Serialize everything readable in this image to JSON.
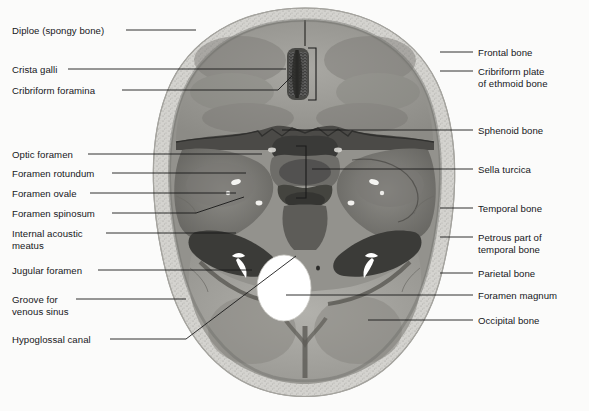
{
  "figure": {
    "kind": "anatomical-illustration",
    "view": "superior",
    "background_color": "#fbfbfa",
    "leader_color": "#1a1a1a",
    "text_color": "#16171a"
  },
  "labels_left": [
    {
      "id": "diploe",
      "text": "Diploe (spongy bone)",
      "x": 12,
      "y": 25,
      "line": [
        [
          126,
          30
        ],
        [
          196,
          30
        ]
      ]
    },
    {
      "id": "crista-galli",
      "text": "Crista galli",
      "x": 12,
      "y": 64,
      "line": [
        [
          68,
          69
        ],
        [
          286,
          69
        ]
      ]
    },
    {
      "id": "cribriform-foramina",
      "text": "Cribriform foramina",
      "x": 12,
      "y": 85,
      "line": [
        [
          122,
          90
        ],
        [
          278,
          90
        ],
        [
          292,
          76
        ]
      ]
    },
    {
      "id": "optic-foramen",
      "text": "Optic foramen",
      "x": 12,
      "y": 149,
      "line": [
        [
          88,
          154
        ],
        [
          262,
          154
        ]
      ]
    },
    {
      "id": "foramen-rotundum",
      "text": "Foramen rotundum",
      "x": 12,
      "y": 168,
      "line": [
        [
          112,
          173
        ],
        [
          246,
          173
        ]
      ]
    },
    {
      "id": "foramen-ovale",
      "text": "Foramen ovale",
      "x": 12,
      "y": 188,
      "line": [
        [
          90,
          193
        ],
        [
          236,
          193
        ]
      ]
    },
    {
      "id": "foramen-spinosum",
      "text": "Foramen spinosum",
      "x": 12,
      "y": 208,
      "line": [
        [
          112,
          213
        ],
        [
          196,
          213
        ],
        [
          244,
          197
        ]
      ]
    },
    {
      "id": "internal-acoustic-meatus",
      "text": "Internal acoustic\nmeatus",
      "x": 12,
      "y": 228,
      "line": [
        [
          106,
          233
        ],
        [
          236,
          233
        ]
      ]
    },
    {
      "id": "jugular-foramen",
      "text": "Jugular foramen",
      "x": 12,
      "y": 265,
      "line": [
        [
          98,
          270
        ],
        [
          252,
          270
        ]
      ]
    },
    {
      "id": "groove-venous-sinus",
      "text": "Groove for\nvenous sinus",
      "x": 12,
      "y": 294,
      "line": [
        [
          76,
          299
        ],
        [
          186,
          299
        ]
      ]
    },
    {
      "id": "hypoglossal-canal",
      "text": "Hypoglossal canal",
      "x": 12,
      "y": 334,
      "line": [
        [
          110,
          339
        ],
        [
          186,
          339
        ],
        [
          296,
          256
        ]
      ]
    }
  ],
  "labels_right": [
    {
      "id": "frontal-bone",
      "text": "Frontal bone",
      "x": 478,
      "y": 47,
      "line": [
        [
          440,
          52
        ],
        [
          473,
          52
        ]
      ]
    },
    {
      "id": "cribriform-plate",
      "text": "Cribriform plate\nof ethmoid bone",
      "x": 478,
      "y": 66,
      "line": [
        [
          440,
          71
        ],
        [
          473,
          71
        ]
      ]
    },
    {
      "id": "sphenoid-bone",
      "text": "Sphenoid bone",
      "x": 478,
      "y": 125,
      "line": [
        [
          282,
          130
        ],
        [
          473,
          130
        ]
      ]
    },
    {
      "id": "sella-turcica",
      "text": "Sella turcica",
      "x": 478,
      "y": 164,
      "line": [
        [
          312,
          169
        ],
        [
          473,
          169
        ]
      ]
    },
    {
      "id": "temporal-bone",
      "text": "Temporal bone",
      "x": 478,
      "y": 203,
      "line": [
        [
          440,
          208
        ],
        [
          473,
          208
        ]
      ]
    },
    {
      "id": "petrous-part",
      "text": "Petrous part of\ntemporal bone",
      "x": 478,
      "y": 232,
      "line": [
        [
          440,
          237
        ],
        [
          473,
          237
        ]
      ]
    },
    {
      "id": "parietal-bone",
      "text": "Parietal bone",
      "x": 478,
      "y": 268,
      "line": [
        [
          440,
          273
        ],
        [
          473,
          273
        ]
      ]
    },
    {
      "id": "foramen-magnum",
      "text": "Foramen magnum",
      "x": 478,
      "y": 290,
      "line": [
        [
          286,
          295
        ],
        [
          473,
          295
        ]
      ]
    },
    {
      "id": "occipital-bone",
      "text": "Occipital bone",
      "x": 478,
      "y": 315,
      "line": [
        [
          368,
          320
        ],
        [
          473,
          320
        ]
      ]
    }
  ]
}
